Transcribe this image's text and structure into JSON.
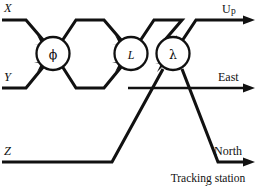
{
  "figure": {
    "kind": "signal-flow-diagram",
    "caption_line1": "Tracking station",
    "caption_line2": "coordinates",
    "ink_color": "#111111",
    "background_color": "#ffffff"
  },
  "inputs": [
    {
      "id": "x",
      "label": "X"
    },
    {
      "id": "y",
      "label": "Y"
    },
    {
      "id": "z",
      "label": "Z"
    }
  ],
  "nodes": [
    {
      "id": "phi",
      "label": "ϕ",
      "name": "latitude-rotation-node"
    },
    {
      "id": "l",
      "label": "L",
      "name": "longitude-rotation-node"
    },
    {
      "id": "lambda",
      "label": "λ",
      "name": "lambda-rotation-node"
    }
  ],
  "outputs": [
    {
      "id": "up",
      "label": "U",
      "sublabel": "p",
      "full": "Up"
    },
    {
      "id": "east",
      "label": "East",
      "sublabel": "",
      "full": "East"
    },
    {
      "id": "north",
      "label": "North",
      "sublabel": "",
      "full": "North"
    }
  ]
}
